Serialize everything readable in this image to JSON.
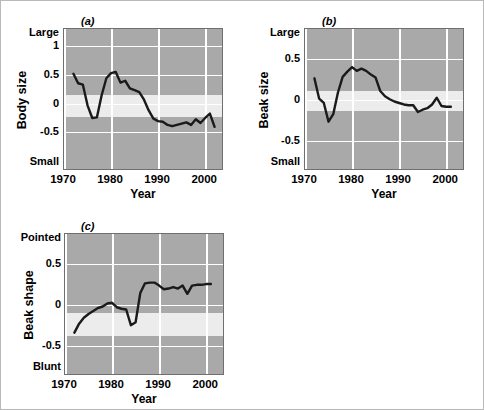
{
  "figure": {
    "background": "#ffffff",
    "border_color": "#b9b9b9",
    "plot_bg": "#a9a9a9",
    "band_color": "#ececec",
    "grid_color": "#ffffff",
    "line_color": "#1a1a1a"
  },
  "chart_data": [
    {
      "type": "line",
      "panel": "(a)",
      "title": "",
      "xlabel": "Year",
      "ylabel": "Body size",
      "y_top_label": "Large",
      "y_bottom_label": "Small",
      "xlim": [
        1970,
        2004
      ],
      "ylim": [
        -0.95,
        1.3
      ],
      "xticks": [
        1970,
        1980,
        1990,
        2000
      ],
      "yticks": [
        1,
        0.5,
        0,
        -0.5
      ],
      "ytick_labels": [
        "1",
        "0.5",
        "0",
        "-0.5"
      ],
      "grid": true,
      "legend": "none",
      "band": [
        0.2,
        0.55
      ],
      "x": [
        1972,
        1973,
        1974,
        1975,
        1976,
        1977,
        1978,
        1979,
        1980,
        1981,
        1982,
        1983,
        1984,
        1985,
        1986,
        1987,
        1988,
        1989,
        1990,
        1991,
        1992,
        1993,
        1994,
        1995,
        1996,
        1997,
        1998,
        1999,
        2000,
        2001,
        2002
      ],
      "values": [
        0.59,
        0.44,
        0.42,
        0.09,
        -0.11,
        -0.1,
        0.25,
        0.52,
        0.6,
        0.62,
        0.45,
        0.48,
        0.36,
        0.33,
        0.3,
        0.18,
        0.01,
        -0.12,
        -0.16,
        -0.17,
        -0.22,
        -0.24,
        -0.22,
        -0.2,
        -0.18,
        -0.22,
        -0.13,
        -0.19,
        -0.11,
        -0.04,
        -0.25
      ]
    },
    {
      "type": "line",
      "panel": "(b)",
      "title": "",
      "xlabel": "Year",
      "ylabel": "Beak size",
      "y_top_label": "Large",
      "y_bottom_label": "Small",
      "xlim": [
        1970,
        2004
      ],
      "ylim": [
        -0.95,
        0.95
      ],
      "xticks": [
        1970,
        1980,
        1990,
        2000
      ],
      "yticks": [
        0.5,
        0,
        -0.5
      ],
      "ytick_labels": [
        "0.5",
        "0",
        "-0.5"
      ],
      "grid": true,
      "legend": "none",
      "band": [
        -0.13,
        0.12
      ],
      "x": [
        1972,
        1973,
        1974,
        1975,
        1976,
        1977,
        1978,
        1979,
        1980,
        1981,
        1982,
        1983,
        1984,
        1985,
        1986,
        1987,
        1988,
        1989,
        1990,
        1991,
        1992,
        1993,
        1994,
        1995,
        1996,
        1997,
        1998,
        1999,
        2000,
        2001
      ],
      "values": [
        0.29,
        0.02,
        -0.04,
        -0.29,
        -0.19,
        0.1,
        0.31,
        0.38,
        0.44,
        0.39,
        0.42,
        0.39,
        0.34,
        0.3,
        0.12,
        0.05,
        0.01,
        -0.02,
        -0.04,
        -0.06,
        -0.07,
        -0.07,
        -0.16,
        -0.13,
        -0.11,
        -0.06,
        0.03,
        -0.08,
        -0.09,
        -0.09
      ]
    },
    {
      "type": "line",
      "panel": "(c)",
      "title": "",
      "xlabel": "Year",
      "ylabel": "Beak shape",
      "y_top_label": "Pointed",
      "y_bottom_label": "Blunt",
      "xlim": [
        1970,
        2004
      ],
      "ylim": [
        -0.95,
        0.95
      ],
      "xticks": [
        1970,
        1980,
        1990,
        2000
      ],
      "yticks": [
        0.5,
        0,
        -0.5
      ],
      "ytick_labels": [
        "0.5",
        "0",
        "-0.5"
      ],
      "grid": true,
      "legend": "none",
      "band": [
        -0.38,
        -0.1
      ],
      "x": [
        1972,
        1973,
        1974,
        1975,
        1976,
        1977,
        1978,
        1979,
        1980,
        1981,
        1982,
        1983,
        1984,
        1985,
        1986,
        1987,
        1988,
        1989,
        1990,
        1991,
        1992,
        1993,
        1994,
        1995,
        1996,
        1997,
        1998,
        1999,
        2000,
        2001
      ],
      "values": [
        -0.37,
        -0.25,
        -0.17,
        -0.12,
        -0.08,
        -0.04,
        -0.02,
        0.02,
        0.03,
        -0.03,
        -0.05,
        -0.06,
        -0.27,
        -0.23,
        0.16,
        0.29,
        0.3,
        0.3,
        0.26,
        0.21,
        0.22,
        0.24,
        0.22,
        0.26,
        0.15,
        0.26,
        0.27,
        0.27,
        0.28,
        0.28
      ]
    }
  ]
}
